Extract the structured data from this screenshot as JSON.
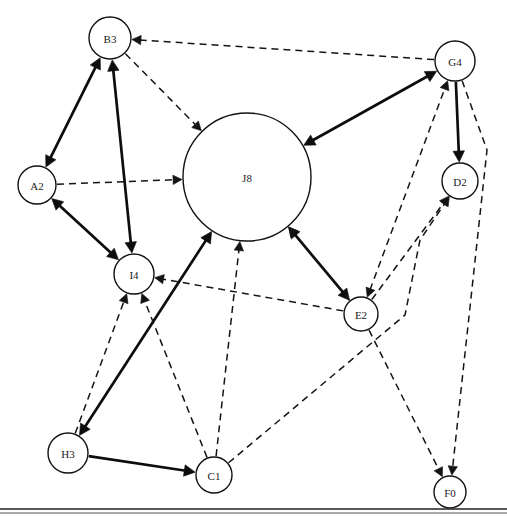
{
  "figure": {
    "kind": "directed-graph",
    "width": 507,
    "height": 522,
    "background_color": "#ffffff",
    "node_fill": "#ffffff",
    "node_stroke": "#111111",
    "solid_edge_color": "#0d0d0d",
    "dashed_edge_color": "#141414"
  },
  "nodes": [
    {
      "id": "B3",
      "label": "B3",
      "cx": 110,
      "cy": 38,
      "r": 21
    },
    {
      "id": "G4",
      "label": "G4",
      "cx": 455,
      "cy": 61,
      "r": 20
    },
    {
      "id": "A2",
      "label": "A2",
      "cx": 37,
      "cy": 185,
      "r": 19
    },
    {
      "id": "J8",
      "label": "J8",
      "cx": 247,
      "cy": 177,
      "r": 64
    },
    {
      "id": "D2",
      "label": "D2",
      "cx": 460,
      "cy": 181,
      "r": 18
    },
    {
      "id": "I4",
      "label": "I4",
      "cx": 134,
      "cy": 274,
      "r": 20
    },
    {
      "id": "E2",
      "label": "E2",
      "cx": 361,
      "cy": 314,
      "r": 17
    },
    {
      "id": "H3",
      "label": "H3",
      "cx": 68,
      "cy": 453,
      "r": 20
    },
    {
      "id": "C1",
      "label": "C1",
      "cx": 214,
      "cy": 475,
      "r": 18
    },
    {
      "id": "F0",
      "label": "F0",
      "cx": 450,
      "cy": 492,
      "r": 16
    }
  ],
  "edges": [
    {
      "from": "B3",
      "to": "A2",
      "style": "solid",
      "direction": "both",
      "name": "edge-b3-a2"
    },
    {
      "from": "B3",
      "to": "I4",
      "style": "solid",
      "direction": "both",
      "name": "edge-b3-i4"
    },
    {
      "from": "A2",
      "to": "I4",
      "style": "solid",
      "direction": "both",
      "name": "edge-a2-i4"
    },
    {
      "from": "B3",
      "to": "J8",
      "style": "dashed",
      "direction": "forward",
      "name": "edge-b3-j8"
    },
    {
      "from": "A2",
      "to": "J8",
      "style": "dashed",
      "direction": "forward",
      "name": "edge-a2-j8"
    },
    {
      "from": "G4",
      "to": "B3",
      "style": "dashed",
      "direction": "forward",
      "name": "edge-g4-b3"
    },
    {
      "from": "G4",
      "to": "J8",
      "style": "solid",
      "direction": "both",
      "name": "edge-g4-j8"
    },
    {
      "from": "G4",
      "to": "D2",
      "style": "solid",
      "direction": "forward",
      "name": "edge-g4-d2"
    },
    {
      "from": "E2",
      "to": "G4",
      "style": "dashed",
      "direction": "both",
      "name": "edge-e2-g4"
    },
    {
      "from": "E2",
      "to": "D2",
      "style": "dashed",
      "direction": "forward",
      "name": "edge-e2-d2"
    },
    {
      "from": "J8",
      "to": "E2",
      "style": "solid",
      "direction": "both",
      "name": "edge-j8-e2"
    },
    {
      "from": "E2",
      "to": "J8",
      "style": "dashed",
      "direction": "forward",
      "name": "edge-e2-j8"
    },
    {
      "from": "E2",
      "to": "I4",
      "style": "dashed",
      "direction": "forward",
      "name": "edge-e2-i4"
    },
    {
      "from": "H3",
      "to": "J8",
      "style": "solid",
      "direction": "both",
      "name": "edge-h3-j8"
    },
    {
      "from": "H3",
      "to": "I4",
      "style": "dashed",
      "direction": "forward",
      "name": "edge-h3-i4"
    },
    {
      "from": "H3",
      "to": "C1",
      "style": "solid",
      "direction": "forward",
      "name": "edge-h3-c1"
    },
    {
      "from": "C1",
      "to": "I4",
      "style": "dashed",
      "direction": "forward",
      "name": "edge-c1-i4"
    },
    {
      "from": "C1",
      "to": "J8",
      "style": "dashed",
      "direction": "forward",
      "name": "edge-c1-j8"
    },
    {
      "from": "C1",
      "to": "D2",
      "style": "dashed",
      "direction": "forward",
      "name": "edge-c1-d2",
      "waypoints": [
        [
          405,
          315
        ],
        [
          420,
          240
        ]
      ]
    },
    {
      "from": "E2",
      "to": "F0",
      "style": "dashed",
      "direction": "forward",
      "name": "edge-e2-f0"
    },
    {
      "from": "G4",
      "to": "F0",
      "style": "dashed",
      "direction": "forward",
      "name": "edge-g4-f0",
      "waypoints": [
        [
          487,
          150
        ]
      ]
    }
  ]
}
